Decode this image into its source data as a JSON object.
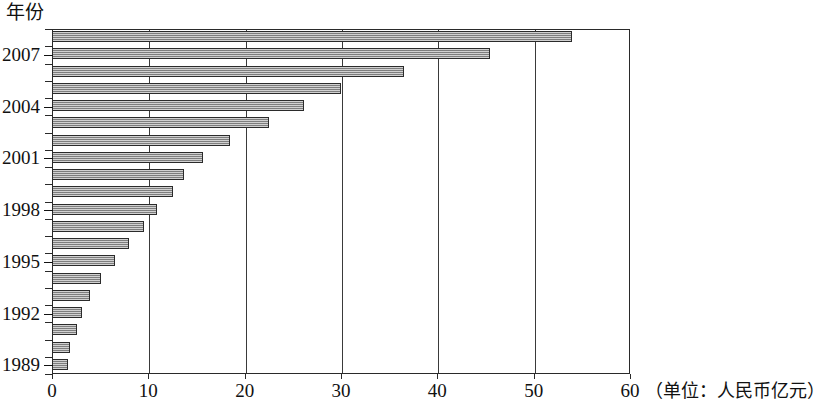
{
  "chart": {
    "type": "bar",
    "orientation": "horizontal",
    "yaxis_title": "年份",
    "xaxis_unit_label": "（单位：人民币亿元）",
    "bar_color": "#9a9a9a",
    "bar_border_color": "#2b2b2b",
    "frame_color": "#2a2a2a"
  },
  "chart_data": {
    "type": "bar",
    "title": "",
    "subtitle": "",
    "xlabel": "（单位：人民币亿元）",
    "ylabel": "年份",
    "orientation": "horizontal",
    "grid": true,
    "legend": false,
    "xlim": [
      0,
      60
    ],
    "xticks": [
      0,
      10,
      20,
      30,
      40,
      50,
      60
    ],
    "xtick_labels": [
      "0",
      "10",
      "20",
      "30",
      "40",
      "50",
      "60"
    ],
    "categories": [
      "2008",
      "2007",
      "2006",
      "2005",
      "2004",
      "2003",
      "2002",
      "2001",
      "2000",
      "1999",
      "1998",
      "1997",
      "1996",
      "1995",
      "1994",
      "1993",
      "1992",
      "1991",
      "1990",
      "1989"
    ],
    "values": [
      54.0,
      45.5,
      36.5,
      30.0,
      26.2,
      22.5,
      18.5,
      15.7,
      13.7,
      12.6,
      10.9,
      9.6,
      8.0,
      6.5,
      5.1,
      3.9,
      3.1,
      2.6,
      1.9,
      1.7
    ],
    "ytick_labels_shown": [
      "2007",
      "2004",
      "2001",
      "1998",
      "1995",
      "1992",
      "1989"
    ]
  }
}
